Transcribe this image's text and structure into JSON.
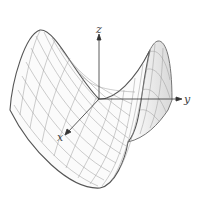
{
  "figure": {
    "type": "3d-surface",
    "axes": {
      "x_label": "x",
      "y_label": "y",
      "z_label": "z"
    },
    "colors": {
      "mesh": "#8a8a8a",
      "outline": "#555555",
      "axis": "#333333",
      "shade": "#e6e6e6"
    }
  }
}
